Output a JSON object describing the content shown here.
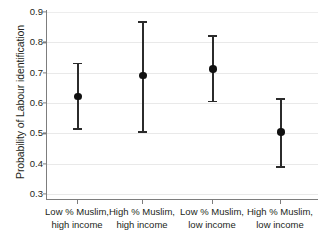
{
  "chart_data": {
    "type": "scatter",
    "title": "",
    "xlabel": "",
    "ylabel": "Probability of Labour identification",
    "ylim": [
      0.3,
      0.9
    ],
    "yticks": [
      "0.3",
      "0.4",
      "0.5",
      "0.6",
      "0.7",
      "0.8",
      "0.9"
    ],
    "ytick_values": [
      0.3,
      0.4,
      0.5,
      0.6,
      0.7,
      0.8,
      0.9
    ],
    "grid": true,
    "legend": "none",
    "categories": [
      "Low % Muslim, high income",
      "High % Muslim, high income",
      "Low % Muslim, low income",
      "High % Muslim, low income"
    ],
    "category_lines": [
      [
        "Low % Muslim,",
        "high income"
      ],
      [
        "High % Muslim,",
        "high income"
      ],
      [
        "Low % Muslim,",
        "low income"
      ],
      [
        "High % Muslim,",
        "low income"
      ]
    ],
    "values": [
      0.622,
      0.69,
      0.712,
      0.505
    ],
    "error_low": [
      0.515,
      0.505,
      0.605,
      0.39
    ],
    "error_high": [
      0.73,
      0.868,
      0.82,
      0.612
    ],
    "points": [
      {
        "label": "Low % Muslim, high income",
        "estimate": 0.622,
        "ci_low": 0.515,
        "ci_high": 0.73
      },
      {
        "label": "High % Muslim, high income",
        "estimate": 0.69,
        "ci_low": 0.505,
        "ci_high": 0.868
      },
      {
        "label": "Low % Muslim, low income",
        "estimate": 0.712,
        "ci_low": 0.605,
        "ci_high": 0.82
      },
      {
        "label": "High % Muslim, low income",
        "estimate": 0.505,
        "ci_low": 0.39,
        "ci_high": 0.612
      }
    ],
    "colors": {
      "marker": "#111111",
      "errorbar": "#2b2b2b",
      "gridline": "#e9e9e9",
      "axis": "#7d7d7d",
      "text": "#231f20",
      "background": "#ffffff"
    }
  }
}
